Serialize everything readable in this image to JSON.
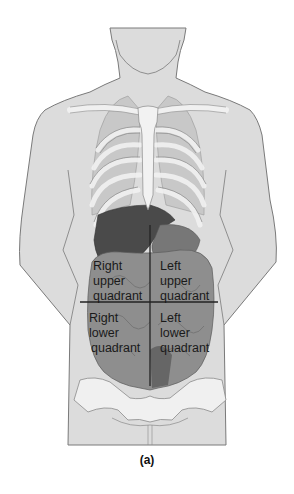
{
  "figure": {
    "caption": "(a)",
    "colors": {
      "skin": "#dcdcdc",
      "outline": "#7a7a7a",
      "bone": "#f0f0f0",
      "organ_dark": "#4a4a4a",
      "intestine": "#8e8e8e",
      "divider_line": "#222222"
    },
    "quadrants": {
      "right_upper": [
        "Right",
        "upper",
        "quadrant"
      ],
      "left_upper": [
        "Left",
        "upper",
        "quadrant"
      ],
      "right_lower": [
        "Right",
        "lower",
        "quadrant"
      ],
      "left_lower": [
        "Left",
        "lower",
        "quadrant"
      ]
    }
  }
}
